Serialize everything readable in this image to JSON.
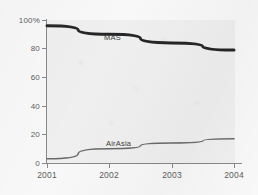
{
  "chart_data": {
    "type": "line",
    "title": "",
    "subtitle": "",
    "xlabel": "",
    "ylabel": "",
    "x": [
      "2001",
      "2002",
      "2003",
      "2004"
    ],
    "categories": [
      "2001",
      "2002",
      "2003",
      "2004"
    ],
    "series": [
      {
        "name": "MAS",
        "label": "MAS",
        "color": "#262626",
        "line_width": 3,
        "values": [
          96,
          90,
          84,
          79
        ]
      },
      {
        "name": "AirAsia",
        "label": "AirAsia",
        "color": "#6b6b6b",
        "line_width": 1.6,
        "values": [
          3,
          10,
          14,
          17
        ]
      }
    ],
    "ylim": [
      0,
      100
    ],
    "yticks": [
      0,
      20,
      40,
      60,
      80,
      100
    ],
    "ytick_labels": [
      "0",
      "20",
      "40",
      "60",
      "80",
      "100%"
    ],
    "xticks": [
      "2001",
      "2002",
      "2003",
      "2004"
    ],
    "grid": false,
    "legend": "inline-series-labels",
    "plot_background": "#f2f2f2",
    "axis_color": "#8a8a8a",
    "tick_label_color": "#5d5d5d"
  },
  "axes": {
    "y": {
      "ticks": [
        {
          "label": "100%",
          "value": 100
        },
        {
          "label": "80",
          "value": 80
        },
        {
          "label": "60",
          "value": 60
        },
        {
          "label": "40",
          "value": 40
        },
        {
          "label": "20",
          "value": 20
        },
        {
          "label": "0",
          "value": 0
        }
      ]
    },
    "x": {
      "ticks": [
        {
          "label": "2001",
          "value": 2001
        },
        {
          "label": "2002",
          "value": 2002
        },
        {
          "label": "2003",
          "value": 2003
        },
        {
          "label": "2004",
          "value": 2004
        }
      ]
    }
  }
}
